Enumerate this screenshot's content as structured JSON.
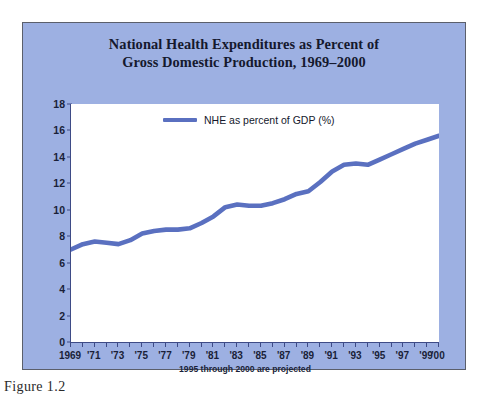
{
  "figure": {
    "caption": "Figure 1.2"
  },
  "chart_data": {
    "type": "line",
    "title": "National Health Expenditures as Percent of Gross Domestic Production, 1969–2000",
    "title_line1": "National Health Expenditures as Percent of",
    "title_line2": "Gross Domestic Production, 1969–2000",
    "xlabel": "",
    "ylabel": "",
    "note": "1995 through 2000 are projected",
    "legend_position": "inside-top-center",
    "grid": false,
    "ylim": [
      0,
      18
    ],
    "ytick_step": 2,
    "yticks": [
      0,
      2,
      4,
      6,
      8,
      10,
      12,
      14,
      16,
      18
    ],
    "xlim": [
      1969,
      2000
    ],
    "xticks_all": [
      1969,
      1970,
      1971,
      1972,
      1973,
      1974,
      1975,
      1976,
      1977,
      1978,
      1979,
      1980,
      1981,
      1982,
      1983,
      1984,
      1985,
      1986,
      1987,
      1988,
      1989,
      1990,
      1991,
      1992,
      1993,
      1994,
      1995,
      1996,
      1997,
      1998,
      1999,
      2000
    ],
    "xtick_labels": [
      {
        "x": 1969,
        "label": "1969"
      },
      {
        "x": 1971,
        "label": "'71"
      },
      {
        "x": 1973,
        "label": "'73"
      },
      {
        "x": 1975,
        "label": "'75"
      },
      {
        "x": 1977,
        "label": "'77"
      },
      {
        "x": 1979,
        "label": "'79"
      },
      {
        "x": 1981,
        "label": "'81"
      },
      {
        "x": 1983,
        "label": "'83"
      },
      {
        "x": 1985,
        "label": "'85"
      },
      {
        "x": 1987,
        "label": "'87"
      },
      {
        "x": 1989,
        "label": "'89"
      },
      {
        "x": 1991,
        "label": "'91"
      },
      {
        "x": 1993,
        "label": "'93"
      },
      {
        "x": 1995,
        "label": "'95"
      },
      {
        "x": 1997,
        "label": "'97"
      },
      {
        "x": 1999,
        "label": "'99"
      },
      {
        "x": 2000,
        "label": "'00"
      }
    ],
    "series": [
      {
        "name": "NHE as percent of GDP (%)",
        "color": "#5a70c0",
        "x": [
          1969,
          1970,
          1971,
          1972,
          1973,
          1974,
          1975,
          1976,
          1977,
          1978,
          1979,
          1980,
          1981,
          1982,
          1983,
          1984,
          1985,
          1986,
          1987,
          1988,
          1989,
          1990,
          1991,
          1992,
          1993,
          1994,
          1995,
          1996,
          1997,
          1998,
          1999,
          2000
        ],
        "values": [
          7.0,
          7.4,
          7.6,
          7.5,
          7.4,
          7.7,
          8.2,
          8.4,
          8.5,
          8.5,
          8.6,
          9.0,
          9.5,
          10.2,
          10.4,
          10.3,
          10.3,
          10.5,
          10.8,
          11.2,
          11.4,
          12.1,
          12.9,
          13.4,
          13.5,
          13.4,
          13.8,
          14.2,
          14.6,
          15.0,
          15.3,
          15.6
        ]
      }
    ],
    "annotations": []
  },
  "legend": {
    "entries": [
      {
        "label": "NHE as percent of GDP (%)",
        "color": "#5a70c0"
      }
    ]
  },
  "colors": {
    "panel_background": "#9db0e2",
    "plot_background": "#ffffff",
    "axis": "#3e4b86",
    "line": "#5a70c0",
    "text": "#15192e",
    "page_background": "#ffffff"
  }
}
